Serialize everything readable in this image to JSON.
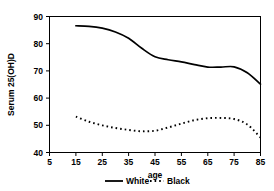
{
  "chart_data": {
    "type": "line",
    "title": "",
    "xlabel": "age",
    "ylabel": "Serum 25(OH)D",
    "xlim": [
      5,
      85
    ],
    "ylim": [
      40,
      90
    ],
    "xticks": [
      5,
      15,
      25,
      35,
      45,
      55,
      65,
      75,
      85
    ],
    "yticks": [
      40,
      50,
      60,
      70,
      80,
      90
    ],
    "grid": false,
    "legend_position": "bottom-center",
    "x": [
      15,
      20,
      25,
      30,
      35,
      40,
      45,
      50,
      55,
      60,
      65,
      70,
      75,
      80,
      85
    ],
    "series": [
      {
        "name": "White",
        "style": "solid",
        "color": "#000000",
        "values": [
          86.6,
          86.4,
          85.7,
          84.3,
          82.0,
          78.3,
          75.2,
          74.1,
          73.3,
          72.3,
          71.4,
          71.4,
          71.5,
          69.3,
          65.1
        ]
      },
      {
        "name": "Black",
        "style": "dotted",
        "color": "#000000",
        "values": [
          53.2,
          51.3,
          50.0,
          49.0,
          48.3,
          47.8,
          48.0,
          49.2,
          50.6,
          51.9,
          52.6,
          52.7,
          52.3,
          50.3,
          45.5
        ]
      }
    ]
  },
  "axes": {
    "x_tick_labels": [
      "5",
      "15",
      "25",
      "35",
      "45",
      "55",
      "65",
      "75",
      "85"
    ],
    "y_tick_labels": [
      "40",
      "50",
      "60",
      "70",
      "80",
      "90"
    ],
    "x_axis_title": "age",
    "y_axis_title": "Serum 25(OH)D"
  },
  "legend": {
    "entries": [
      {
        "label": "White",
        "style": "solid"
      },
      {
        "label": "Black",
        "style": "dotted"
      }
    ]
  }
}
